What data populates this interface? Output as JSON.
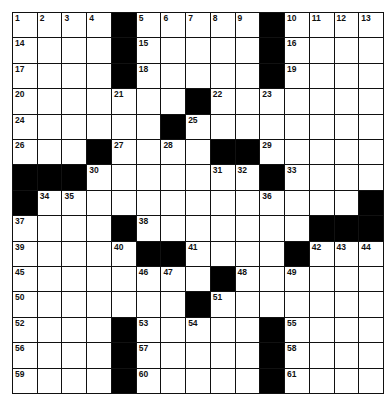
{
  "puzzle": {
    "rows": 15,
    "cols": 15,
    "layout": [
      "1,2,3,4,#,5,6,7,8,9,#,10,11,12,13",
      "14,.,.,.,#,15,.,.,.,.,#,16,.,.,.",
      "17,.,.,.,#,18,.,.,.,.,#,19,.,.,.",
      "20,.,.,.,21,.,.,#,22,.,23,.,.,.,.",
      "24,.,.,.,.,.,#,25,.,.,.,.,.,.,.",
      "26,.,.,#,27,.,28,.,#,#,29,.,.,.,.",
      "#,#,#,30,.,.,.,.,31,32,#,33,.,.,.",
      "#,34,35,.,.,.,.,.,.,.,36,.,.,.,#",
      "37,.,.,.,#,38,.,.,.,.,.,.,#,#,#",
      "39,.,.,.,40,#,#,41,.,.,.,#,42,43,44",
      "45,.,.,.,.,46,47,.,#,48,.,49,.,.,.",
      "50,.,.,.,.,.,.,#,51,.,.,.,.,.,.",
      "52,.,.,.,#,53,.,54,.,.,#,55,.,.,.",
      "56,.,.,.,#,57,.,.,.,.,#,58,.,.,.",
      "59,.,.,.,#,60,.,.,.,.,#,61,.,.,."
    ]
  }
}
